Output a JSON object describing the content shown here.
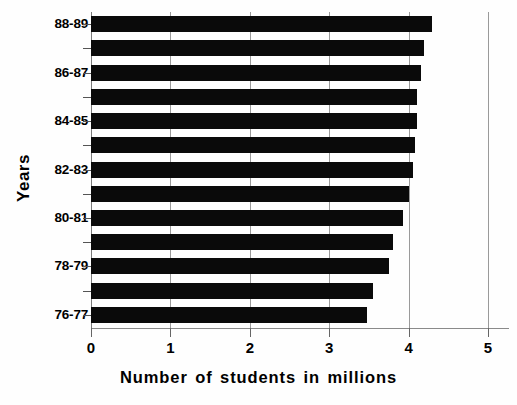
{
  "chart_data": {
    "type": "bar",
    "orientation": "horizontal",
    "title": "",
    "xlabel": "Number of students in millions",
    "ylabel": "Years",
    "categories": [
      "76-77",
      "77-78",
      "78-79",
      "79-80",
      "80-81",
      "81-82",
      "82-83",
      "83-84",
      "84-85",
      "85-86",
      "86-87",
      "87-88",
      "88-89"
    ],
    "values": [
      3.47,
      3.55,
      3.75,
      3.8,
      3.93,
      4.0,
      4.05,
      4.08,
      4.1,
      4.11,
      4.15,
      4.2,
      4.3
    ],
    "xlim": [
      0,
      5
    ],
    "xticks": [
      0,
      1,
      2,
      3,
      4,
      5
    ],
    "xtick_labels": [
      "0",
      "1",
      "2",
      "3",
      "4",
      "5"
    ],
    "ytick_labels_shown": [
      "76-77",
      "78-79",
      "80-81",
      "82-83",
      "84-85",
      "86-87",
      "88-89"
    ],
    "grid": "vertical",
    "legend": "none",
    "bar_color": "#0a0a0a",
    "series": [
      {
        "name": "Number of students in millions",
        "values": [
          3.47,
          3.55,
          3.75,
          3.8,
          3.93,
          4.0,
          4.05,
          4.08,
          4.1,
          4.11,
          4.15,
          4.2,
          4.3
        ]
      }
    ]
  },
  "axes": {
    "y_title": "Years",
    "x_title": "Number of students in millions"
  },
  "x_ticks": [
    {
      "label": "0",
      "value": 0
    },
    {
      "label": "1",
      "value": 1
    },
    {
      "label": "2",
      "value": 2
    },
    {
      "label": "3",
      "value": 3
    },
    {
      "label": "4",
      "value": 4
    },
    {
      "label": "5",
      "value": 5
    }
  ],
  "bars": [
    {
      "category": "88-89",
      "value": 4.3,
      "label_visible": "88-89"
    },
    {
      "category": "87-88",
      "value": 4.2,
      "label_visible": ""
    },
    {
      "category": "86-87",
      "value": 4.15,
      "label_visible": "86-87"
    },
    {
      "category": "85-86",
      "value": 4.11,
      "label_visible": ""
    },
    {
      "category": "84-85",
      "value": 4.1,
      "label_visible": "84-85"
    },
    {
      "category": "83-84",
      "value": 4.08,
      "label_visible": ""
    },
    {
      "category": "82-83",
      "value": 4.05,
      "label_visible": "82-83"
    },
    {
      "category": "81-82",
      "value": 4.0,
      "label_visible": ""
    },
    {
      "category": "80-81",
      "value": 3.93,
      "label_visible": "80-81"
    },
    {
      "category": "79-80",
      "value": 3.8,
      "label_visible": ""
    },
    {
      "category": "78-79",
      "value": 3.75,
      "label_visible": "78-79"
    },
    {
      "category": "77-78",
      "value": 3.55,
      "label_visible": ""
    },
    {
      "category": "76-77",
      "value": 3.47,
      "label_visible": "76-77"
    }
  ]
}
